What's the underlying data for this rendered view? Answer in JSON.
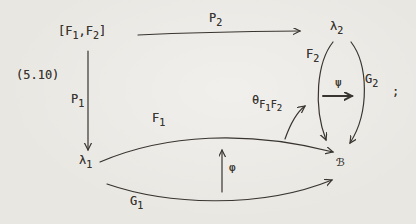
{
  "figure": {
    "equation_number": "(5.10)",
    "terminal_punctuation": ";"
  },
  "colors": {
    "ink": "#38342f",
    "paper": "#e9e7e2"
  },
  "nodes": {
    "source": {
      "name": "[F1,F2]",
      "segments": [
        {
          "t": "[F"
        },
        {
          "t": "1",
          "s": 1
        },
        {
          "t": ",F"
        },
        {
          "t": "2",
          "s": 1
        },
        {
          "t": "]"
        }
      ]
    },
    "a1": {
      "name": "lambda-1",
      "segments": [
        {
          "t": "λ"
        },
        {
          "t": "1",
          "s": 1
        }
      ]
    },
    "a2": {
      "name": "lambda-2",
      "segments": [
        {
          "t": "λ"
        },
        {
          "t": "2",
          "s": 1
        }
      ]
    },
    "b": {
      "name": "script-B",
      "segments": [
        {
          "t": "ℬ"
        }
      ]
    }
  },
  "labels": {
    "p1": {
      "segments": [
        {
          "t": "P"
        },
        {
          "t": "1",
          "s": 1
        }
      ]
    },
    "p2": {
      "segments": [
        {
          "t": "P"
        },
        {
          "t": "2",
          "s": 1
        }
      ]
    },
    "f1": {
      "segments": [
        {
          "t": "F"
        },
        {
          "t": "1",
          "s": 1
        }
      ]
    },
    "f2": {
      "segments": [
        {
          "t": "F"
        },
        {
          "t": "2",
          "s": 1
        }
      ]
    },
    "g1": {
      "segments": [
        {
          "t": "G"
        },
        {
          "t": "1",
          "s": 1
        }
      ]
    },
    "g2": {
      "segments": [
        {
          "t": "G"
        },
        {
          "t": "2",
          "s": 1
        }
      ]
    },
    "phi": {
      "segments": [
        {
          "t": "φ"
        }
      ]
    },
    "psi": {
      "segments": [
        {
          "t": "ψ"
        }
      ]
    },
    "theta": {
      "segments": [
        {
          "t": "θ"
        },
        {
          "t": "F",
          "s": 1
        },
        {
          "t": "1",
          "s": 2
        },
        {
          "t": "F",
          "s": 1
        },
        {
          "t": "2",
          "s": 2
        }
      ]
    }
  }
}
